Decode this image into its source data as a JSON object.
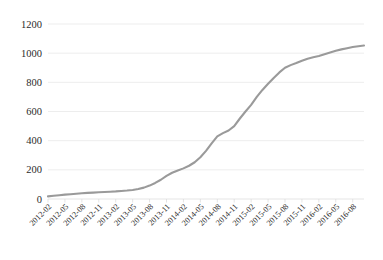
{
  "chart_data": {
    "type": "line",
    "title": "",
    "subtitle": "",
    "xlabel": "",
    "ylabel": "",
    "grid": true,
    "legend": false,
    "legend_position": "none",
    "series_color": "#9a9a9a",
    "ylim": [
      0,
      1200
    ],
    "ytick_labels": [
      "0",
      "200",
      "400",
      "600",
      "800",
      "1000",
      "1200"
    ],
    "ytick_values": [
      0,
      200,
      400,
      600,
      800,
      1000,
      1200
    ],
    "xtick_labels": [
      "2012-02",
      "2012-05",
      "2012-08",
      "2012-11",
      "2013-02",
      "2013-05",
      "2013-08",
      "2013-11",
      "2014-02",
      "2014-05",
      "2014-08",
      "2014-11",
      "2015-02",
      "2015-05",
      "2015-08",
      "2015-11",
      "2016-02",
      "2016-05",
      "2016-08"
    ],
    "xtick_label_rotation": 45,
    "x": [
      "2012-02",
      "2012-03",
      "2012-04",
      "2012-05",
      "2012-06",
      "2012-07",
      "2012-08",
      "2012-09",
      "2012-10",
      "2012-11",
      "2012-12",
      "2013-01",
      "2013-02",
      "2013-03",
      "2013-04",
      "2013-05",
      "2013-06",
      "2013-07",
      "2013-08",
      "2013-09",
      "2013-10",
      "2013-11",
      "2013-12",
      "2014-01",
      "2014-02",
      "2014-03",
      "2014-04",
      "2014-05",
      "2014-06",
      "2014-07",
      "2014-08",
      "2014-09",
      "2014-10",
      "2014-11",
      "2014-12",
      "2015-01",
      "2015-02",
      "2015-03",
      "2015-04",
      "2015-05",
      "2015-06",
      "2015-07",
      "2015-08",
      "2015-09",
      "2015-10",
      "2015-11",
      "2015-12",
      "2016-01",
      "2016-02",
      "2016-03",
      "2016-04",
      "2016-05",
      "2016-06",
      "2016-07",
      "2016-08",
      "2016-09",
      "2016-10"
    ],
    "series": [
      {
        "name": "cumulative",
        "values": [
          18,
          22,
          26,
          30,
          33,
          36,
          39,
          42,
          44,
          46,
          48,
          50,
          52,
          55,
          58,
          62,
          68,
          78,
          92,
          110,
          132,
          158,
          180,
          196,
          210,
          228,
          252,
          286,
          330,
          382,
          430,
          452,
          470,
          500,
          552,
          600,
          645,
          700,
          748,
          790,
          830,
          868,
          900,
          918,
          932,
          948,
          962,
          972,
          980,
          992,
          1004,
          1016,
          1026,
          1034,
          1042,
          1048,
          1052
        ]
      }
    ]
  }
}
